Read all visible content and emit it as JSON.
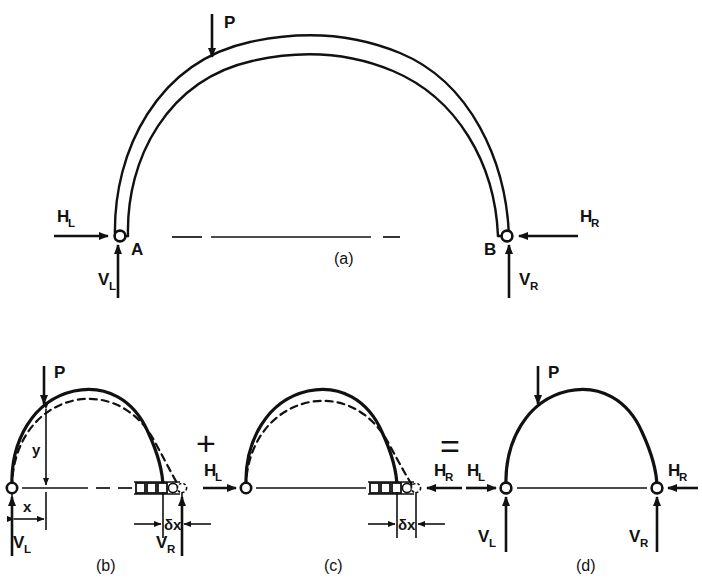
{
  "figure": {
    "panels": [
      {
        "id": "a",
        "label": "(a)",
        "caption_x": 351,
        "caption_y": 258,
        "description": "Ribbed arch ABclamped at pinned supports A and B with applied load P and reactions",
        "supports": [
          {
            "name": "A",
            "type": "pin"
          },
          {
            "name": "B",
            "type": "pin"
          }
        ],
        "forces": [
          {
            "symbol": "P",
            "sub": "",
            "direction": "down"
          },
          {
            "symbol": "H",
            "sub": "L",
            "direction": "right"
          },
          {
            "symbol": "H",
            "sub": "R",
            "direction": "left"
          },
          {
            "symbol": "V",
            "sub": "L",
            "direction": "up"
          },
          {
            "symbol": "V",
            "sub": "R",
            "direction": "up"
          }
        ]
      },
      {
        "id": "b",
        "label": "(b)",
        "caption_x": 112,
        "caption_y": 565,
        "description": "Arch with vertical load P, right end on roller free to spread by delta x; deflected shape dashed",
        "supports": [
          {
            "name": "",
            "type": "pin"
          },
          {
            "name": "",
            "type": "roller"
          }
        ],
        "forces": [
          {
            "symbol": "P",
            "sub": "",
            "direction": "down"
          },
          {
            "symbol": "V",
            "sub": "L",
            "direction": "up"
          },
          {
            "symbol": "V",
            "sub": "R",
            "direction": "up"
          }
        ],
        "dimensions": [
          {
            "symbol": "y",
            "orientation": "vertical"
          },
          {
            "symbol": "x",
            "orientation": "horizontal"
          },
          {
            "symbol": "δx",
            "orientation": "horizontal"
          }
        ]
      },
      {
        "id": "c",
        "label": "(c)",
        "caption_x": 340,
        "caption_y": 565,
        "description": "Arch loaded only by horizontal thrusts H_L and H_R closing the spread delta x; deflected shape dashed",
        "supports": [
          {
            "name": "",
            "type": "pin"
          },
          {
            "name": "",
            "type": "roller"
          }
        ],
        "forces": [
          {
            "symbol": "H",
            "sub": "L",
            "direction": "right"
          },
          {
            "symbol": "H",
            "sub": "R",
            "direction": "left"
          }
        ],
        "dimensions": [
          {
            "symbol": "δx",
            "orientation": "horizontal"
          }
        ]
      },
      {
        "id": "d",
        "label": "(d)",
        "caption_x": 592,
        "caption_y": 565,
        "description": "Resultant arch with load P and full pinned reactions at both ends",
        "supports": [
          {
            "name": "",
            "type": "pin"
          },
          {
            "name": "",
            "type": "pin"
          }
        ],
        "forces": [
          {
            "symbol": "P",
            "sub": "",
            "direction": "down"
          },
          {
            "symbol": "H",
            "sub": "L",
            "direction": "right"
          },
          {
            "symbol": "H",
            "sub": "R",
            "direction": "left"
          },
          {
            "symbol": "V",
            "sub": "L",
            "direction": "up"
          },
          {
            "symbol": "V",
            "sub": "R",
            "direction": "up"
          }
        ]
      }
    ],
    "operators": [
      {
        "symbol": "+",
        "x": 206,
        "y": 444
      },
      {
        "symbol": "=",
        "x": 451,
        "y": 452
      }
    ],
    "labels": {
      "P": "P",
      "H": "H",
      "V": "V",
      "sub_L": "L",
      "sub_R": "R",
      "point_A": "A",
      "point_B": "B",
      "dim_x": "x",
      "dim_y": "y",
      "dim_dx": "δx",
      "panel_a": "(a)",
      "panel_b": "(b)",
      "panel_c": "(c)",
      "panel_d": "(d)"
    },
    "colors": {
      "ink": "#111111",
      "paper": "#ffffff"
    }
  }
}
